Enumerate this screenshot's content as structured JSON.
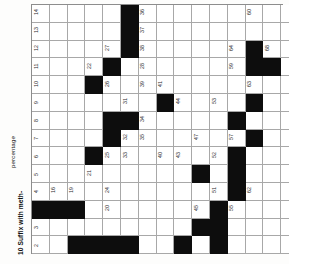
{
  "page": {
    "orientation": "rotated-90-ccw",
    "background": "#fdfdfc"
  },
  "clues": {
    "number_label": "10",
    "clue_text": "Suffix with meth-",
    "partial_clue": "percentage"
  },
  "grid": {
    "columns": 14,
    "rows": 15,
    "cell_size": 17.8,
    "fill_color": "#ffffff",
    "block_color": "#0d0d0d",
    "border_color": "#a8a8a8",
    "blocks": [
      [
        0,
        5
      ],
      [
        1,
        5
      ],
      [
        2,
        5
      ],
      [
        3,
        4
      ],
      [
        4,
        3
      ],
      [
        5,
        7
      ],
      [
        6,
        4
      ],
      [
        6,
        5
      ],
      [
        7,
        4
      ],
      [
        8,
        3
      ],
      [
        11,
        0
      ],
      [
        11,
        1
      ],
      [
        11,
        2
      ],
      [
        2,
        12
      ],
      [
        3,
        12
      ],
      [
        3,
        13
      ],
      [
        5,
        12
      ],
      [
        6,
        11
      ],
      [
        7,
        12
      ],
      [
        8,
        11
      ],
      [
        9,
        11
      ],
      [
        9,
        9
      ],
      [
        10,
        11
      ],
      [
        11,
        10
      ],
      [
        12,
        10
      ],
      [
        13,
        10
      ],
      [
        14,
        10
      ],
      [
        12,
        9
      ],
      [
        13,
        2
      ],
      [
        13,
        3
      ],
      [
        13,
        4
      ],
      [
        13,
        5
      ],
      [
        13,
        8
      ]
    ],
    "numbers": [
      {
        "n": "14",
        "c": 0,
        "r": 0
      },
      {
        "n": "36",
        "c": 0,
        "r": 6
      },
      {
        "n": "60",
        "c": 0,
        "r": 12
      },
      {
        "n": "13",
        "c": 1,
        "r": 0
      },
      {
        "n": "37",
        "c": 1,
        "r": 6
      },
      {
        "n": "12",
        "c": 2,
        "r": 0
      },
      {
        "n": "27",
        "c": 2,
        "r": 4
      },
      {
        "n": "38",
        "c": 2,
        "r": 6
      },
      {
        "n": "64",
        "c": 2,
        "r": 11
      },
      {
        "n": "66",
        "c": 2,
        "r": 12
      },
      {
        "n": "68",
        "c": 2,
        "r": 13
      },
      {
        "n": "11",
        "c": 3,
        "r": 0
      },
      {
        "n": "22",
        "c": 3,
        "r": 3
      },
      {
        "n": "28",
        "c": 3,
        "r": 6
      },
      {
        "n": "59",
        "c": 3,
        "r": 11
      },
      {
        "n": "10",
        "c": 4,
        "r": 0
      },
      {
        "n": "26",
        "c": 4,
        "r": 4
      },
      {
        "n": "39",
        "c": 4,
        "r": 6
      },
      {
        "n": "41",
        "c": 4,
        "r": 7
      },
      {
        "n": "63",
        "c": 4,
        "r": 12
      },
      {
        "n": "9",
        "c": 5,
        "r": 0
      },
      {
        "n": "31",
        "c": 5,
        "r": 5
      },
      {
        "n": "44",
        "c": 5,
        "r": 8
      },
      {
        "n": "53",
        "c": 5,
        "r": 10
      },
      {
        "n": "8",
        "c": 6,
        "r": 0
      },
      {
        "n": "30",
        "c": 6,
        "r": 4
      },
      {
        "n": "34",
        "c": 6,
        "r": 6
      },
      {
        "n": "58",
        "c": 6,
        "r": 11
      },
      {
        "n": "7",
        "c": 7,
        "r": 0
      },
      {
        "n": "29",
        "c": 7,
        "r": 4
      },
      {
        "n": "32",
        "c": 7,
        "r": 5
      },
      {
        "n": "35",
        "c": 7,
        "r": 6
      },
      {
        "n": "47",
        "c": 7,
        "r": 9
      },
      {
        "n": "57",
        "c": 7,
        "r": 11
      },
      {
        "n": "6",
        "c": 8,
        "r": 0
      },
      {
        "n": "25",
        "c": 8,
        "r": 4
      },
      {
        "n": "33",
        "c": 8,
        "r": 5
      },
      {
        "n": "40",
        "c": 8,
        "r": 7
      },
      {
        "n": "43",
        "c": 8,
        "r": 8
      },
      {
        "n": "52",
        "c": 8,
        "r": 10
      },
      {
        "n": "5",
        "c": 9,
        "r": 0
      },
      {
        "n": "21",
        "c": 9,
        "r": 3
      },
      {
        "n": "46",
        "c": 9,
        "r": 9
      },
      {
        "n": "56",
        "c": 9,
        "r": 11
      },
      {
        "n": "4",
        "c": 10,
        "r": 0
      },
      {
        "n": "16",
        "c": 10,
        "r": 1
      },
      {
        "n": "19",
        "c": 10,
        "r": 2
      },
      {
        "n": "24",
        "c": 10,
        "r": 4
      },
      {
        "n": "51",
        "c": 10,
        "r": 10
      },
      {
        "n": "62",
        "c": 10,
        "r": 12
      },
      {
        "n": "20",
        "c": 11,
        "r": 4
      },
      {
        "n": "45",
        "c": 11,
        "r": 9
      },
      {
        "n": "55",
        "c": 11,
        "r": 11
      },
      {
        "n": "3",
        "c": 12,
        "r": 0
      },
      {
        "n": "50",
        "c": 12,
        "r": 10
      },
      {
        "n": "2",
        "c": 13,
        "r": 0
      },
      {
        "n": "23",
        "c": 13,
        "r": 4
      },
      {
        "n": "49",
        "c": 13,
        "r": 10
      },
      {
        "n": "1",
        "c": 14,
        "r": 0
      },
      {
        "n": "15",
        "c": 14,
        "r": 1
      },
      {
        "n": "17",
        "c": 14,
        "r": 2
      },
      {
        "n": "18",
        "c": 14,
        "r": 3
      },
      {
        "n": "20b",
        "c": 14,
        "r": 4
      },
      {
        "n": "33b",
        "c": 14,
        "r": 5
      },
      {
        "n": "38b",
        "c": 14,
        "r": 6
      },
      {
        "n": "42",
        "c": 14,
        "r": 7
      },
      {
        "n": "48",
        "c": 14,
        "r": 9
      },
      {
        "n": "54",
        "c": 14,
        "r": 10
      },
      {
        "n": "61",
        "c": 14,
        "r": 11
      },
      {
        "n": "65",
        "c": 14,
        "r": 12
      },
      {
        "n": "67",
        "c": 14,
        "r": 13
      }
    ]
  }
}
